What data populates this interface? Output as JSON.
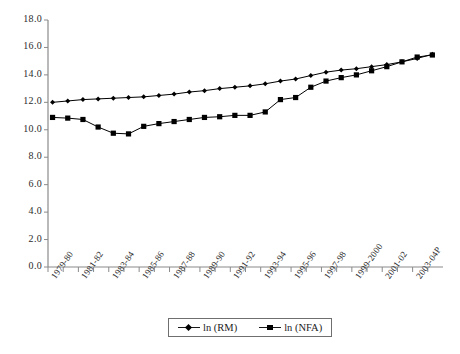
{
  "chart_data": {
    "type": "line",
    "title": "",
    "subtitle": "",
    "xlabel": "",
    "ylabel": "",
    "ylim": [
      0.0,
      18.0
    ],
    "ytick_labels": [
      "0.0",
      "2.0",
      "4.0",
      "6.0",
      "8.0",
      "10.0",
      "12.0",
      "14.0",
      "16.0",
      "18.0"
    ],
    "ytick_values": [
      0.0,
      2.0,
      4.0,
      6.0,
      8.0,
      10.0,
      12.0,
      14.0,
      16.0,
      18.0
    ],
    "grid": false,
    "legend_position": "bottom-center",
    "categories": [
      "1979-80",
      "1980-81",
      "1981-82",
      "1982-83",
      "1983-84",
      "1984-85",
      "1985-86",
      "1986-87",
      "1987-88",
      "1988-89",
      "1989-90",
      "1990-91",
      "1991-92",
      "1992-93",
      "1993-94",
      "1994-95",
      "1995-96",
      "1996-97",
      "1997-98",
      "1998-99",
      "1999-2000",
      "2000-01",
      "2001-02",
      "2002-03",
      "2003-04P",
      "2004-05"
    ],
    "xtick_labels_shown": [
      "1979-80",
      "1981-82",
      "1983-84",
      "1985-86",
      "1987-88",
      "1989-90",
      "1991-92",
      "1993-94",
      "1995-96",
      "1997-98",
      "1999-2000",
      "2001-02",
      "2003-04P"
    ],
    "series": [
      {
        "name": "ln (RM)",
        "marker": "diamond",
        "color": "#000000",
        "values": [
          12.0,
          12.1,
          12.2,
          12.25,
          12.3,
          12.35,
          12.4,
          12.5,
          12.6,
          12.75,
          12.85,
          13.0,
          13.1,
          13.2,
          13.35,
          13.55,
          13.7,
          13.95,
          14.2,
          14.35,
          14.45,
          14.6,
          14.75,
          14.95,
          15.2,
          15.5
        ]
      },
      {
        "name": "ln (NFA)",
        "marker": "square",
        "color": "#000000",
        "values": [
          10.9,
          10.85,
          10.75,
          10.2,
          9.75,
          9.7,
          10.25,
          10.45,
          10.6,
          10.75,
          10.9,
          10.95,
          11.05,
          11.05,
          11.3,
          12.2,
          12.35,
          13.1,
          13.55,
          13.8,
          14.0,
          14.3,
          14.6,
          14.95,
          15.3,
          15.45
        ]
      }
    ]
  },
  "legend": {
    "items": [
      {
        "label": "ln (RM)"
      },
      {
        "label": "ln (NFA)"
      }
    ]
  }
}
